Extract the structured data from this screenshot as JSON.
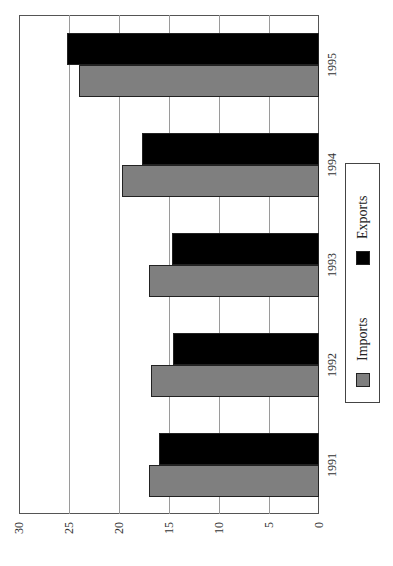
{
  "chart_data": {
    "type": "bar",
    "orientation": "horizontal-rotated",
    "title": "",
    "xlabel": "",
    "ylabel": "",
    "categories": [
      "1991",
      "1992",
      "1993",
      "1994",
      "1995"
    ],
    "series": [
      {
        "name": "Imports",
        "color": "#7f7f7f",
        "values": [
          17.0,
          16.8,
          17.0,
          19.7,
          24.0
        ]
      },
      {
        "name": "Exports",
        "color": "#000000",
        "values": [
          16.0,
          14.6,
          14.7,
          17.7,
          25.2
        ]
      }
    ],
    "value_axis": {
      "ticks": [
        "0",
        "5",
        "10",
        "15",
        "20",
        "25",
        "30"
      ],
      "range": [
        0,
        30
      ]
    },
    "grid": true,
    "legend": {
      "position": "right",
      "entries": [
        "Imports",
        "Exports"
      ]
    }
  },
  "legend": {
    "imports_label": "Imports",
    "exports_label": "Exports"
  },
  "ticks": [
    "0",
    "5",
    "10",
    "15",
    "20",
    "25",
    "30"
  ],
  "categories": [
    "1991",
    "1992",
    "1993",
    "1994",
    "1995"
  ]
}
